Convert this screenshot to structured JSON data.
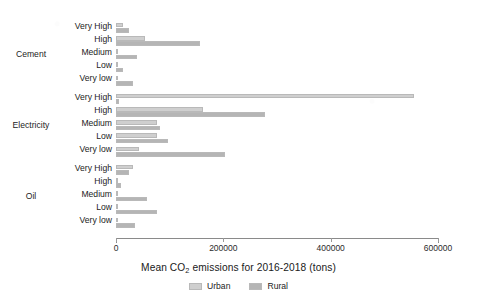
{
  "chart_data": {
    "type": "bar",
    "orientation": "horizontal",
    "title": "",
    "xlabel": "Mean CO₂ emissions for 2016-2018 (tons)",
    "xlabel_parts": {
      "prefix": "Mean CO",
      "sub": "2",
      "suffix": " emissions for 2016-2018 (tons)"
    },
    "ylabel": "",
    "xlim": [
      0,
      600000
    ],
    "xticks": [
      0,
      200000,
      400000,
      600000
    ],
    "xtick_labels": [
      "0",
      "200000",
      "400000",
      "600000"
    ],
    "grid": false,
    "legend": {
      "position": "bottom-center",
      "entries": [
        {
          "name": "Urban",
          "color": "#cfcfcf"
        },
        {
          "name": "Rural",
          "color": "#b5b5b5"
        }
      ]
    },
    "series": [
      {
        "name": "Urban",
        "color": "#cfcfcf"
      },
      {
        "name": "Rural",
        "color": "#b5b5b5"
      }
    ],
    "groups": [
      {
        "name": "Cement",
        "categories": [
          "Very High",
          "High",
          "Medium",
          "Low",
          "Very low"
        ],
        "values": {
          "Urban": [
            13000,
            54000,
            2000,
            0,
            0
          ],
          "Rural": [
            24000,
            157000,
            39000,
            13000,
            32000
          ]
        }
      },
      {
        "name": "Electricity",
        "categories": [
          "Very High",
          "High",
          "Medium",
          "Low",
          "Very low"
        ],
        "values": {
          "Urban": [
            555000,
            163000,
            77000,
            77000,
            43000
          ],
          "Rural": [
            5000,
            278000,
            82000,
            97000,
            204000
          ]
        }
      },
      {
        "name": "Oil",
        "categories": [
          "Very High",
          "High",
          "Medium",
          "Low",
          "Very low"
        ],
        "values": {
          "Urban": [
            32000,
            4000,
            1000,
            1000,
            0
          ],
          "Rural": [
            24000,
            9000,
            58000,
            77000,
            36000
          ]
        }
      }
    ]
  },
  "colors": {
    "urban": "#cfcfcf",
    "rural": "#b5b5b5",
    "axis": "#8a8a8a",
    "text": "#232323",
    "background": "#ffffff"
  }
}
